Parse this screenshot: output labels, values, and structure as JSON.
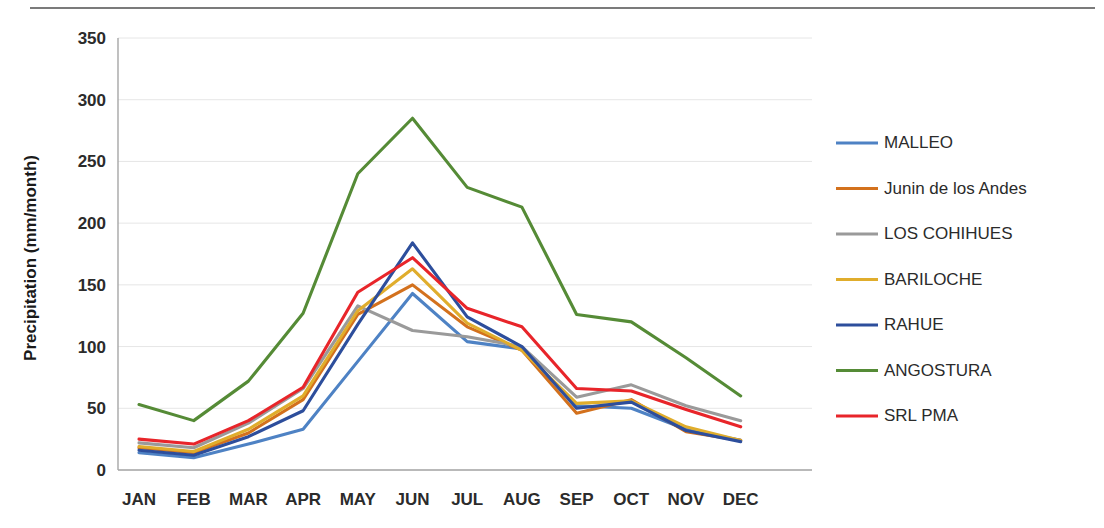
{
  "chart_data": {
    "type": "line",
    "title": "",
    "xlabel": "",
    "ylabel": "Precipitation (mm/month)",
    "categories": [
      "JAN",
      "FEB",
      "MAR",
      "APR",
      "MAY",
      "JUN",
      "JUL",
      "AUG",
      "SEP",
      "OCT",
      "NOV",
      "DEC"
    ],
    "ylim": [
      0,
      350
    ],
    "yticks": [
      0,
      50,
      100,
      150,
      200,
      250,
      300,
      350
    ],
    "ytick_labels": [
      "0",
      "50",
      "100",
      "150",
      "200",
      "250",
      "300",
      "350"
    ],
    "grid": "horizontal",
    "legend_position": "right",
    "series": [
      {
        "name": "MALLEO",
        "color": "#4e82c4",
        "values": [
          14,
          10,
          21,
          33,
          88,
          143,
          104,
          98,
          52,
          50,
          33,
          24
        ]
      },
      {
        "name": "Junin de los Andes",
        "color": "#d3711d",
        "values": [
          18,
          14,
          30,
          57,
          126,
          150,
          116,
          97,
          46,
          57,
          31,
          24
        ]
      },
      {
        "name": "LOS COHIHUES",
        "color": "#9a9a9a",
        "values": [
          22,
          18,
          38,
          66,
          133,
          113,
          108,
          100,
          59,
          69,
          52,
          40
        ]
      },
      {
        "name": "BARILOCHE",
        "color": "#e0ad2c",
        "values": [
          19,
          15,
          33,
          60,
          129,
          163,
          119,
          97,
          54,
          56,
          35,
          24
        ]
      },
      {
        "name": "RAHUE",
        "color": "#2d4e9c",
        "values": [
          16,
          12,
          27,
          48,
          118,
          184,
          124,
          100,
          50,
          55,
          32,
          23
        ]
      },
      {
        "name": "ANGOSTURA",
        "color": "#558b36",
        "values": [
          53,
          40,
          72,
          127,
          240,
          285,
          229,
          213,
          126,
          120,
          91,
          60
        ]
      },
      {
        "name": "SRL PMA",
        "color": "#e8252a",
        "values": [
          25,
          21,
          40,
          67,
          144,
          172,
          131,
          116,
          66,
          64,
          49,
          35
        ]
      }
    ]
  },
  "plot": {
    "x_left": 118,
    "x_right": 812,
    "y_top": 38,
    "y_bottom": 470,
    "first_category_x": 139,
    "category_spacing": 54.7
  },
  "legend": {
    "x_swatch_start": 836,
    "x_swatch_end": 878,
    "x_label": 884,
    "y_first": 143,
    "y_spacing": 45.5
  }
}
